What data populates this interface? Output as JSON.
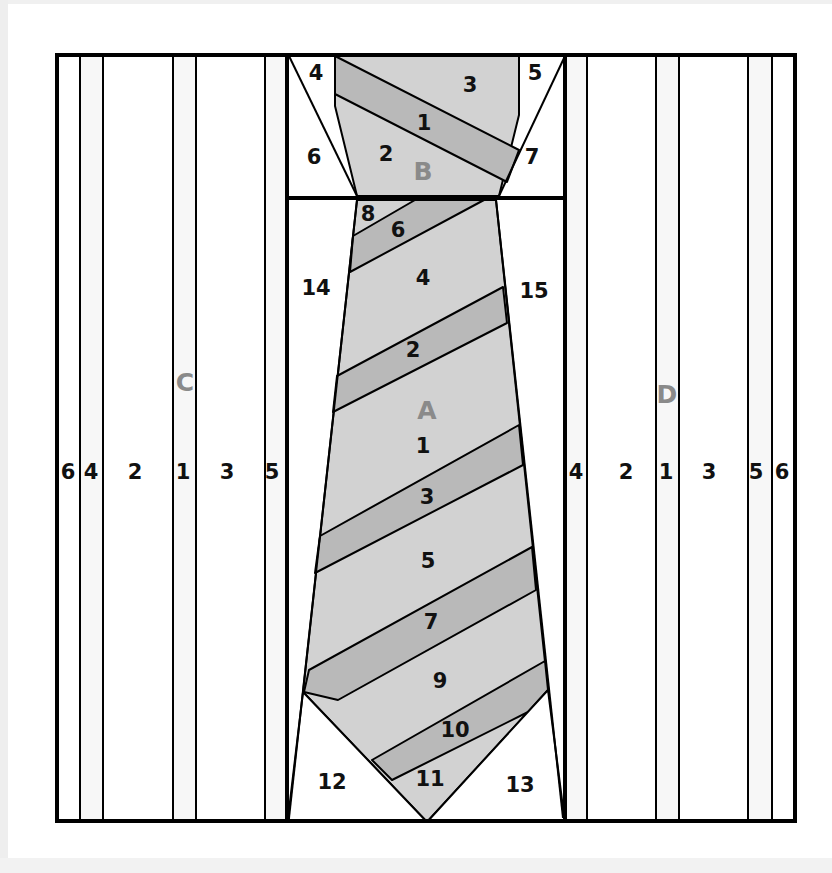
{
  "diagram": {
    "colors": {
      "background": "#ffffff",
      "outline": "#000000",
      "tie_light": "#d2d2d2",
      "tie_stripe": "#b9b9b9",
      "section_label": "#8a8a8a",
      "strip_tint": "#f7f7f7"
    },
    "frame": {
      "x": 56,
      "y": 54,
      "w": 740,
      "h": 768
    },
    "sections": {
      "A": {
        "label": "A",
        "x": 427,
        "y": 410
      },
      "B": {
        "label": "B",
        "x": 423,
        "y": 171
      },
      "C": {
        "label": "C",
        "x": 185,
        "y": 382
      },
      "D": {
        "label": "D",
        "x": 667,
        "y": 394
      }
    },
    "section_c": {
      "strips": [
        {
          "label": "6",
          "x": 68,
          "y": 472
        },
        {
          "label": "4",
          "x": 91,
          "y": 472
        },
        {
          "label": "2",
          "x": 135,
          "y": 472
        },
        {
          "label": "1",
          "x": 183,
          "y": 472
        },
        {
          "label": "3",
          "x": 227,
          "y": 472
        },
        {
          "label": "5",
          "x": 272,
          "y": 472
        }
      ]
    },
    "section_d": {
      "strips": [
        {
          "label": "4",
          "x": 576,
          "y": 472
        },
        {
          "label": "2",
          "x": 626,
          "y": 472
        },
        {
          "label": "1",
          "x": 666,
          "y": 472
        },
        {
          "label": "3",
          "x": 709,
          "y": 472
        },
        {
          "label": "5",
          "x": 756,
          "y": 472
        },
        {
          "label": "6",
          "x": 782,
          "y": 472
        }
      ]
    },
    "section_b": {
      "pieces": [
        {
          "label": "1",
          "x": 424,
          "y": 123
        },
        {
          "label": "2",
          "x": 386,
          "y": 154
        },
        {
          "label": "3",
          "x": 470,
          "y": 85
        },
        {
          "label": "4",
          "x": 316,
          "y": 73
        },
        {
          "label": "5",
          "x": 535,
          "y": 73
        },
        {
          "label": "6",
          "x": 314,
          "y": 157
        },
        {
          "label": "7",
          "x": 532,
          "y": 157
        }
      ]
    },
    "section_a": {
      "pieces": [
        {
          "label": "1",
          "x": 423,
          "y": 446
        },
        {
          "label": "2",
          "x": 413,
          "y": 350
        },
        {
          "label": "3",
          "x": 427,
          "y": 497
        },
        {
          "label": "4",
          "x": 423,
          "y": 278
        },
        {
          "label": "5",
          "x": 428,
          "y": 561
        },
        {
          "label": "6",
          "x": 398,
          "y": 230
        },
        {
          "label": "7",
          "x": 431,
          "y": 622
        },
        {
          "label": "8",
          "x": 368,
          "y": 214
        },
        {
          "label": "9",
          "x": 440,
          "y": 681
        },
        {
          "label": "10",
          "x": 455,
          "y": 730
        },
        {
          "label": "11",
          "x": 430,
          "y": 779
        },
        {
          "label": "12",
          "x": 332,
          "y": 782
        },
        {
          "label": "13",
          "x": 520,
          "y": 785
        },
        {
          "label": "14",
          "x": 316,
          "y": 288
        },
        {
          "label": "15",
          "x": 534,
          "y": 291
        }
      ]
    }
  }
}
